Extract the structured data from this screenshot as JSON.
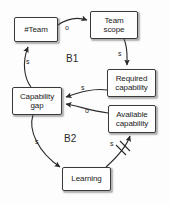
{
  "diagram": {
    "type": "causal-loop-diagram",
    "background_color": "#fdfdfd",
    "stroke_color": "#3a3a3a",
    "nodes": [
      {
        "id": "team",
        "label": "#Team",
        "x": 14,
        "y": 17,
        "w": 44,
        "h": 25
      },
      {
        "id": "scope",
        "label": "Team\nscope",
        "x": 90,
        "y": 11,
        "w": 48,
        "h": 28
      },
      {
        "id": "required",
        "label": "Required\ncapability",
        "x": 107,
        "y": 69,
        "w": 49,
        "h": 28
      },
      {
        "id": "available",
        "label": "Available\ncapability",
        "x": 108,
        "y": 105,
        "w": 48,
        "h": 28
      },
      {
        "id": "gap",
        "label": "Capability\ngap",
        "x": 12,
        "y": 87,
        "w": 50,
        "h": 28
      },
      {
        "id": "learning",
        "label": "Learning",
        "x": 62,
        "y": 167,
        "w": 49,
        "h": 24
      }
    ],
    "loops": [
      {
        "id": "b1",
        "label": "B1",
        "x": 66,
        "y": 53
      },
      {
        "id": "b2",
        "label": "B2",
        "x": 64,
        "y": 133
      }
    ],
    "edges": [
      {
        "id": "team-to-scope",
        "from": "team",
        "to": "scope",
        "polarity": "o",
        "label_x": 65,
        "label_y": 24,
        "delay": false
      },
      {
        "id": "scope-to-required",
        "from": "scope",
        "to": "required",
        "polarity": "s",
        "label_x": 118,
        "label_y": 50,
        "delay": false
      },
      {
        "id": "required-to-gap",
        "from": "required",
        "to": "gap",
        "polarity": "s",
        "label_x": 81,
        "label_y": 84,
        "delay": false
      },
      {
        "id": "available-to-gap",
        "from": "available",
        "to": "gap",
        "polarity": "o",
        "label_x": 85,
        "label_y": 107,
        "delay": false
      },
      {
        "id": "gap-to-team",
        "from": "gap",
        "to": "team",
        "polarity": "s",
        "label_x": 26,
        "label_y": 58,
        "delay": false
      },
      {
        "id": "gap-to-learning",
        "from": "gap",
        "to": "learning",
        "polarity": "s",
        "label_x": 35,
        "label_y": 138,
        "delay": false
      },
      {
        "id": "learning-to-available",
        "from": "learning",
        "to": "available",
        "polarity": "s",
        "label_x": 110,
        "label_y": 140,
        "delay": true
      }
    ]
  }
}
